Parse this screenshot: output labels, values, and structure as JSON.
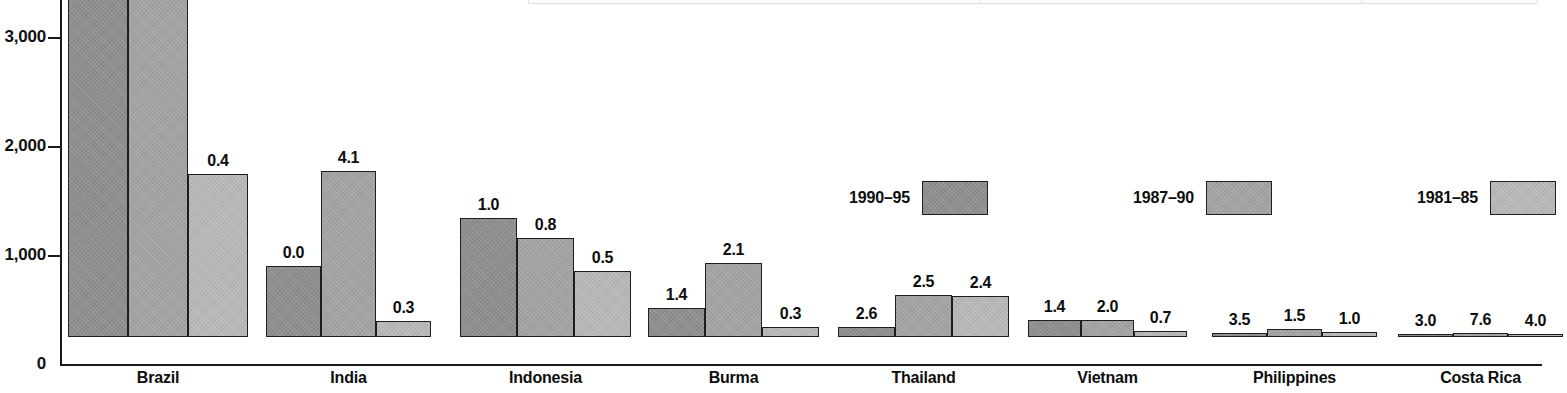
{
  "chart_data": {
    "type": "bar",
    "title": "",
    "xlabel": "",
    "ylabel": "",
    "ylim": [
      0,
      3400
    ],
    "grid": false,
    "legend_position": "middle-right",
    "categories": [
      "Brazil",
      "India",
      "Indonesia",
      "Burma",
      "Thailand",
      "Vietnam",
      "Philippines",
      "Costa Rica"
    ],
    "series": [
      {
        "name": "1990–95",
        "color": "#8d8d8d",
        "values": [
          3670,
          650,
          1090,
          265,
          95,
          160,
          40,
          5
        ],
        "labels": [
          "",
          "0.0",
          "1.0",
          "1.4",
          "2.6",
          "1.4",
          "3.5",
          "3.0"
        ],
        "truncated": [
          true,
          false,
          false,
          false,
          false,
          false,
          false,
          false
        ]
      },
      {
        "name": "1987–90",
        "color": "#a2a2a2",
        "values": [
          3670,
          1520,
          910,
          680,
          385,
          155,
          70,
          40
        ],
        "labels": [
          "",
          "4.1",
          "0.8",
          "2.1",
          "2.5",
          "2.0",
          "1.5",
          "7.6"
        ],
        "truncated": [
          true,
          false,
          false,
          false,
          false,
          false,
          false,
          false
        ]
      },
      {
        "name": "1981–85",
        "color": "#b7b7b7",
        "values": [
          1500,
          150,
          605,
          95,
          375,
          55,
          50,
          20
        ],
        "labels": [
          "0.4",
          "0.3",
          "0.5",
          "0.3",
          "2.4",
          "0.7",
          "1.0",
          "4.0"
        ],
        "truncated": [
          false,
          false,
          false,
          false,
          false,
          false,
          false,
          false
        ]
      }
    ],
    "y_ticks": [
      {
        "value": 0,
        "label": "0"
      },
      {
        "value": 1000,
        "label": "1,000"
      },
      {
        "value": 2000,
        "label": "2,000"
      },
      {
        "value": 3000,
        "label": "3,000"
      }
    ]
  },
  "legend": {
    "items": [
      {
        "label": "1990–95",
        "series": 0
      },
      {
        "label": "1987–90",
        "series": 1
      },
      {
        "label": "1981–85",
        "series": 2
      }
    ]
  }
}
